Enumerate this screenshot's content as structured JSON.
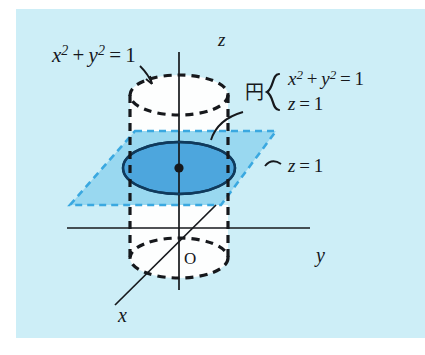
{
  "figure": {
    "type": "geometry-3d-diagram",
    "background_color": "#cdeef7",
    "panel": {
      "x": 16,
      "y": 9,
      "width": 409,
      "height": 329
    },
    "colors": {
      "panel_background": "#cdeef7",
      "page_background": "#ffffff",
      "ink": "#16181c",
      "plane_fill": "#8fd3ef",
      "plane_edge": "#3aa8e0",
      "disk_fill": "#4da6dd",
      "disk_edge": "#103a5c",
      "cylinder_body": "#fdfefe"
    },
    "axes": [
      {
        "name": "z",
        "label": "z",
        "direction": "vertical-up",
        "label_x": 222,
        "label_y": 44
      },
      {
        "name": "y",
        "label": "y",
        "direction": "horizontal-right",
        "label_x": 320,
        "label_y": 258
      },
      {
        "name": "x",
        "label": "x",
        "direction": "diagonal-lower-left",
        "label_x": 122,
        "label_y": 320
      }
    ],
    "origin": {
      "label": "O",
      "x": 186,
      "y": 258
    },
    "labels": {
      "cylinder_equation": {
        "text": "x² + y² = 1",
        "base": "x",
        "exponent": "2",
        "x": 52,
        "y": 58
      },
      "plane_label": {
        "text": "z = 1",
        "x": 286,
        "y": 168
      },
      "circle_callout": {
        "kanji": "円",
        "line1": "x² + y² = 1",
        "line2": "z = 1",
        "x": 248,
        "y": 92
      }
    },
    "cylinder": {
      "center_x": 179,
      "radius_x": 49,
      "radius_y": 20,
      "top_y": 95,
      "bottom_y": 258,
      "stroke_style": "dashed",
      "stroke_color": "#16181c"
    },
    "plane": {
      "z_value": 1,
      "corners": [
        {
          "x": 135,
          "y": 131
        },
        {
          "x": 276,
          "y": 131
        },
        {
          "x": 221,
          "y": 205
        },
        {
          "x": 70,
          "y": 205
        }
      ],
      "stroke_style": "dashed",
      "stroke_color": "#3aa8e0"
    },
    "intersection_disk": {
      "center_x": 179,
      "center_y": 168,
      "radius_x": 56,
      "radius_y": 26,
      "fill": "#4da6dd",
      "stroke": "#103a5c",
      "center_dot": true
    }
  }
}
